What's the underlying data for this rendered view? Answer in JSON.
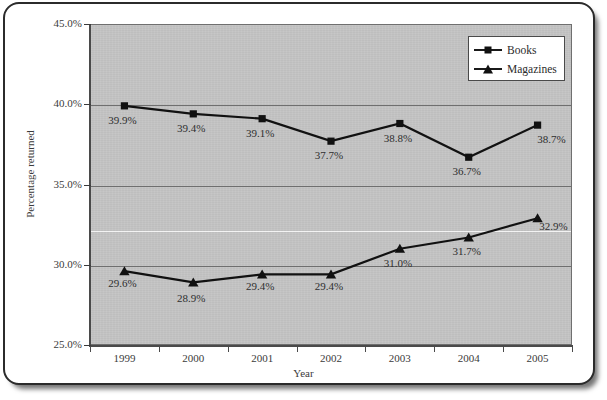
{
  "chart_data": {
    "type": "line",
    "title": "",
    "xlabel": "Year",
    "ylabel": "Percentage returned",
    "categories": [
      "1999",
      "2000",
      "2001",
      "2002",
      "2003",
      "2004",
      "2005"
    ],
    "ylim": [
      25.0,
      45.0
    ],
    "ytick_labels": [
      "45.0%",
      "40.0%",
      "35.0%",
      "30.0%",
      "25.0%"
    ],
    "ytick_values": [
      45.0,
      40.0,
      35.0,
      30.0,
      25.0
    ],
    "grid": true,
    "legend_position": "top-right",
    "series": [
      {
        "name": "Books",
        "marker": "square",
        "values": [
          39.9,
          39.4,
          39.1,
          37.7,
          38.8,
          36.7,
          38.7
        ],
        "labels": [
          "39.9%",
          "39.4%",
          "39.1%",
          "37.7%",
          "38.8%",
          "36.7%",
          "38.7%"
        ]
      },
      {
        "name": "Magazines",
        "marker": "triangle",
        "values": [
          29.6,
          28.9,
          29.4,
          29.4,
          31.0,
          31.7,
          32.9
        ],
        "labels": [
          "29.6%",
          "28.9%",
          "29.4%",
          "29.4%",
          "31.0%",
          "31.7%",
          "32.9%"
        ]
      }
    ],
    "colors": {
      "plot_background": "#c5c5c5",
      "series_line": "#111111",
      "gridline": "#6f6f6f",
      "axis": "#4a4a4a",
      "text": "#2e2e2e"
    }
  },
  "legend": {
    "items": [
      {
        "label": "Books",
        "marker": "square"
      },
      {
        "label": "Magazines",
        "marker": "triangle"
      }
    ]
  }
}
